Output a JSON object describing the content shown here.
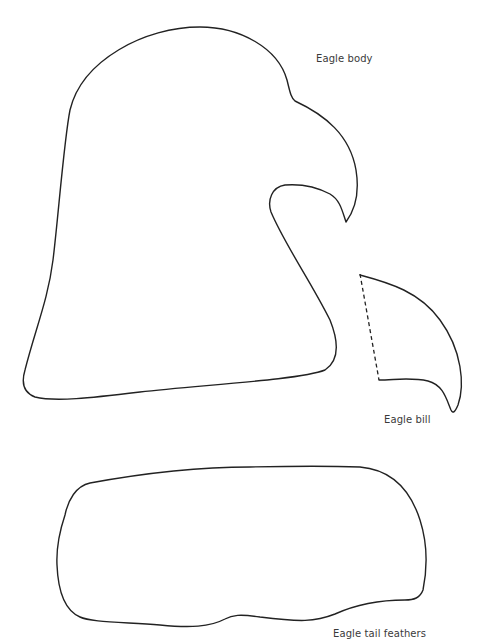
{
  "template": {
    "pieces": [
      {
        "id": "eagle-body",
        "label": "Eagle body"
      },
      {
        "id": "eagle-bill",
        "label": "Eagle bill"
      },
      {
        "id": "eagle-tail-feathers",
        "label": "Eagle tail feathers"
      }
    ],
    "colors": {
      "background": "#ffffff",
      "outline": "#222222",
      "label_text": "#3a3a3a"
    },
    "bill_fold_line": "dashed"
  }
}
